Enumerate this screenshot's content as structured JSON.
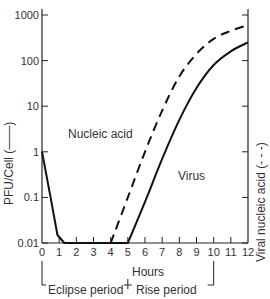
{
  "chart_data": {
    "type": "line",
    "title": "",
    "xlabel": "Hours",
    "ylabel": "PFU/Cell (—)",
    "ylabel_right": "Viral nucleic acid (- - -)",
    "yscale": "log",
    "xlim": [
      0,
      12
    ],
    "ylim": [
      0.01,
      1000
    ],
    "x_ticks": [
      0,
      1,
      2,
      3,
      4,
      5,
      6,
      7,
      8,
      9,
      10,
      11,
      12
    ],
    "x_tick_labels": [
      "0",
      "1",
      "2",
      "3",
      "4",
      "5",
      "6",
      "7",
      "8",
      "9",
      "10",
      "11",
      "12"
    ],
    "y_ticks": [
      0.01,
      0.1,
      1,
      10,
      100,
      1000
    ],
    "y_tick_labels": [
      "0.01",
      "0.1",
      "1",
      "10",
      "100",
      "1000"
    ],
    "grid": false,
    "series": [
      {
        "name": "Virus",
        "style": "solid",
        "x": [
          0,
          0.5,
          0.9,
          1.3,
          5,
          6,
          7,
          8,
          9,
          10,
          11,
          12
        ],
        "values": [
          1,
          0.1,
          0.015,
          0.01,
          0.01,
          0.08,
          0.7,
          5,
          25,
          80,
          160,
          250
        ]
      },
      {
        "name": "Nucleic acid",
        "style": "dashed",
        "x": [
          4,
          5,
          6,
          7,
          8,
          9,
          10,
          11,
          12
        ],
        "values": [
          0.01,
          0.1,
          1,
          8,
          45,
          140,
          300,
          450,
          600
        ]
      }
    ],
    "annotations": [
      {
        "text": "Nucleic acid",
        "x": 3.3,
        "y": 20
      },
      {
        "text": "Virus",
        "x": 7.9,
        "y": 4
      },
      {
        "text": "Eclipse period",
        "from": 0,
        "to": 5
      },
      {
        "text": "Rise period",
        "from": 5,
        "to": 10
      }
    ]
  },
  "labels": {
    "nucleic_acid": "Nucleic acid",
    "virus": "Virus",
    "eclipse": "Eclipse period",
    "rise": "Rise period",
    "xlabel": "Hours",
    "ylabel_left": "PFU/Cell (——)",
    "ylabel_right": "Viral nucleic acid (- - -)"
  }
}
